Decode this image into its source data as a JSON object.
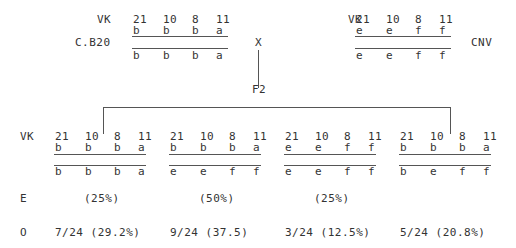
{
  "loci_label": "VK",
  "loci": [
    "21",
    "10",
    "8",
    "11"
  ],
  "cross_symbol": "X",
  "generation_label": "F2",
  "parents": [
    {
      "name": "C.B20",
      "haplotype_top": [
        "b",
        "b",
        "b",
        "a"
      ],
      "haplotype_bottom": [
        "b",
        "b",
        "b",
        "a"
      ]
    },
    {
      "name": "CNV",
      "haplotype_top": [
        "e",
        "e",
        "f",
        "f"
      ],
      "haplotype_bottom": [
        "e",
        "e",
        "f",
        "f"
      ]
    }
  ],
  "row_labels": {
    "expected": "E",
    "observed": "O"
  },
  "offspring": [
    {
      "haplotype_top": [
        "b",
        "b",
        "b",
        "a"
      ],
      "haplotype_bottom": [
        "b",
        "b",
        "b",
        "a"
      ],
      "expected": "(25%)",
      "observed": "7/24 (29.2%)"
    },
    {
      "haplotype_top": [
        "b",
        "b",
        "b",
        "a"
      ],
      "haplotype_bottom": [
        "e",
        "e",
        "f",
        "f"
      ],
      "expected": "(50%)",
      "observed": "9/24 (37.5)"
    },
    {
      "haplotype_top": [
        "e",
        "e",
        "f",
        "f"
      ],
      "haplotype_bottom": [
        "e",
        "e",
        "f",
        "f"
      ],
      "expected": "(25%)",
      "observed": "3/24 (12.5%)"
    },
    {
      "haplotype_top": [
        "b",
        "b",
        "b",
        "a"
      ],
      "haplotype_bottom": [
        "b",
        "e",
        "f",
        "f"
      ],
      "expected": "",
      "observed": "5/24 (20.8%)"
    }
  ]
}
